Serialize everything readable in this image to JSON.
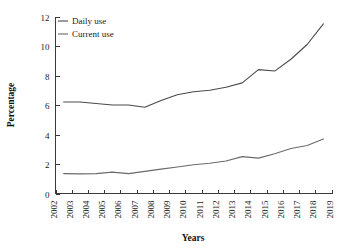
{
  "chart_data": {
    "type": "line",
    "title": "",
    "xlabel": "Years",
    "ylabel": "Percentage",
    "x": [
      2002,
      2003,
      2004,
      2005,
      2006,
      2007,
      2008,
      2009,
      2010,
      2011,
      2012,
      2013,
      2014,
      2015,
      2016,
      2017,
      2018,
      2019
    ],
    "xtick_labels": [
      "2002",
      "2003",
      "2004",
      "2005",
      "2006",
      "2007",
      "2008",
      "2009",
      "2010",
      "2011",
      "2012",
      "2013",
      "2014",
      "2015",
      "2016",
      "2017",
      "2018",
      "2019"
    ],
    "ytick_labels": [
      "0",
      "2",
      "4",
      "6",
      "8",
      "10",
      "12"
    ],
    "yticks": [
      0,
      2,
      4,
      6,
      8,
      10,
      12
    ],
    "xlim": [
      2002,
      2019
    ],
    "ylim": [
      0,
      12
    ],
    "grid": false,
    "legend_position": "top-left",
    "series": [
      {
        "name": "Daily use",
        "color": "#4a4a4a",
        "x": [
          2002.5,
          2003.5,
          2004.5,
          2005.5,
          2006.5,
          2007.5,
          2008.5,
          2009.5,
          2010.5,
          2011.5,
          2012.5,
          2013.5,
          2014.5,
          2015.5,
          2016.5,
          2017.5,
          2018.5
        ],
        "values": [
          6.2,
          6.2,
          6.1,
          6.0,
          6.0,
          5.85,
          6.3,
          6.7,
          6.9,
          7.0,
          7.2,
          7.5,
          8.4,
          8.3,
          9.1,
          10.1,
          11.5
        ]
      },
      {
        "name": "Current use",
        "color": "#6a6a6a",
        "x": [
          2002.5,
          2003.5,
          2004.5,
          2005.5,
          2006.5,
          2007.5,
          2008.5,
          2009.5,
          2010.5,
          2011.5,
          2012.5,
          2013.5,
          2014.5,
          2015.5,
          2016.5,
          2017.5,
          2018.5
        ],
        "values": [
          1.35,
          1.33,
          1.35,
          1.45,
          1.35,
          1.5,
          1.65,
          1.8,
          1.95,
          2.05,
          2.2,
          2.5,
          2.4,
          2.7,
          3.05,
          3.25,
          3.7
        ]
      }
    ]
  },
  "legend": {
    "entries": [
      {
        "label": "Daily use"
      },
      {
        "label": "Current use"
      }
    ]
  },
  "axes": {
    "y_title": "Percentage",
    "x_title": "Years"
  }
}
